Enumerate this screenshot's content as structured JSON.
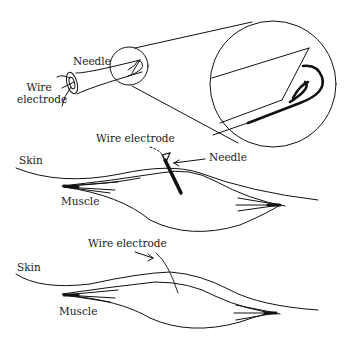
{
  "diagram": {
    "panel_top": {
      "needle_label": "Needle",
      "wire_label_line1": "Wire",
      "wire_label_line2": "electrode"
    },
    "panel_middle": {
      "wire_label": "Wire electrode",
      "needle_label": "Needle",
      "skin_label": "Skin",
      "muscle_label": "Muscle"
    },
    "panel_bottom": {
      "wire_label": "Wire electrode",
      "skin_label": "Skin",
      "muscle_label": "Muscle"
    },
    "colors": {
      "line": "#111111",
      "background": "#ffffff"
    }
  }
}
